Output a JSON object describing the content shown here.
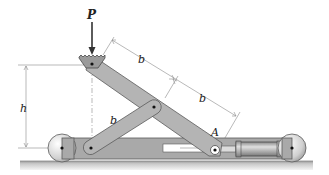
{
  "figure": {
    "labels": {
      "load": "P",
      "height": "h",
      "upper_segment": "b",
      "lower_segment": "b",
      "short_link": "b",
      "pivot": "A"
    },
    "components": [
      "serrated-load-pad",
      "long-link",
      "short-link",
      "base-frame",
      "left-wheel",
      "right-wheel",
      "hydraulic-cylinder",
      "ground"
    ],
    "colors": {
      "link_fill": "#b4b4b4",
      "link_stroke": "#5a5a5a",
      "frame_fill": "#a9a9a9",
      "wheel_fill": "#d8d8d8",
      "ground_fill": "#bdbdbd",
      "dimension_line": "#7a7a7a"
    }
  }
}
